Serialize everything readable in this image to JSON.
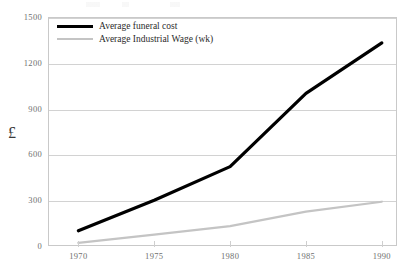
{
  "chart_data": {
    "type": "line",
    "title": "",
    "xlabel": "",
    "ylabel": "£",
    "x": [
      1970,
      1975,
      1980,
      1985,
      1990
    ],
    "xtick_labels": [
      "1970",
      "1975",
      "1980",
      "1985",
      "1990"
    ],
    "ytick_labels": [
      "0",
      "300",
      "600",
      "900",
      "1200",
      "1500"
    ],
    "yticks": [
      0,
      300,
      600,
      900,
      1200,
      1500
    ],
    "ylim": [
      0,
      1500
    ],
    "xlim": [
      1968,
      1991
    ],
    "grid": "horizontal",
    "legend_position": "top-left",
    "series": [
      {
        "name": "Average funeral cost",
        "color": "#000000",
        "width": 3.2,
        "values": [
          100,
          300,
          520,
          1000,
          1330
        ]
      },
      {
        "name": "Average Industrial Wage (wk)",
        "color": "#c4c4c4",
        "width": 2.2,
        "values": [
          20,
          75,
          130,
          225,
          290
        ]
      }
    ]
  },
  "legend": {
    "items": [
      {
        "label": "Average funeral cost"
      },
      {
        "label": "Average Industrial Wage (wk)"
      }
    ]
  },
  "colors": {
    "funeral_cost": "#000000",
    "industrial_wage": "#c4c4c4",
    "gridline": "#d2d2d2",
    "frame": "#c9c9c9",
    "tick_text": "#6f6f6f"
  }
}
